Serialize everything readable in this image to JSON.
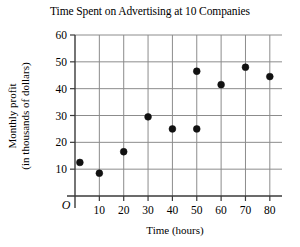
{
  "chart_data": {
    "type": "scatter",
    "title": "Time Spent on Advertising at 10 Companies",
    "xlabel": "Time (hours)",
    "ylabel_line1": "Monthly profit",
    "ylabel_line2": "(in thousands of dollars)",
    "origin_label": "O",
    "xlim": [
      0,
      85
    ],
    "ylim": [
      0,
      60
    ],
    "xticks": [
      10,
      20,
      30,
      40,
      50,
      60,
      70,
      80
    ],
    "yticks": [
      10,
      20,
      30,
      40,
      50,
      60
    ],
    "xtick_labels": [
      "10",
      "20",
      "30",
      "40",
      "50",
      "60",
      "70",
      "80"
    ],
    "ytick_labels": [
      "10",
      "20",
      "30",
      "40",
      "50",
      "60"
    ],
    "grid": true,
    "legend": "none",
    "point_count": 10,
    "x": [
      2,
      10,
      20,
      30,
      40,
      50,
      50,
      60,
      70,
      80
    ],
    "y": [
      12.5,
      8.5,
      16.5,
      29.5,
      25,
      25,
      46.5,
      41.5,
      48,
      44.5
    ],
    "points": [
      {
        "x": 2,
        "y": 12.5
      },
      {
        "x": 10,
        "y": 8.5
      },
      {
        "x": 20,
        "y": 16.5
      },
      {
        "x": 30,
        "y": 29.5
      },
      {
        "x": 40,
        "y": 25
      },
      {
        "x": 50,
        "y": 25
      },
      {
        "x": 50,
        "y": 46.5
      },
      {
        "x": 60,
        "y": 41.5
      },
      {
        "x": 70,
        "y": 48
      },
      {
        "x": 80,
        "y": 44.5
      }
    ],
    "colors": {
      "point": "#111111",
      "grid": "#8c8c8c",
      "axis": "#3a3a3a",
      "background": "#ffffff"
    }
  }
}
